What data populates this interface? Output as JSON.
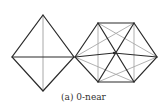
{
  "caption": "(a) 0-near",
  "colors": {
    "dark": "#2a2a2a",
    "light": "#a8a8a8",
    "background": "#ffffff"
  },
  "diamond": {
    "vertices": {
      "top": [
        43,
        15
      ],
      "left": [
        12,
        57
      ],
      "right": [
        74,
        57
      ],
      "bottom": [
        43,
        91
      ]
    }
  },
  "hexagon": {
    "vertices": {
      "left": [
        75,
        57
      ],
      "top_left": [
        98,
        23
      ],
      "top_right": [
        134,
        23
      ],
      "right": [
        157,
        57
      ],
      "bottom_right": [
        134,
        82
      ],
      "bottom_left": [
        98,
        82
      ]
    },
    "center": [
      114,
      53
    ]
  }
}
